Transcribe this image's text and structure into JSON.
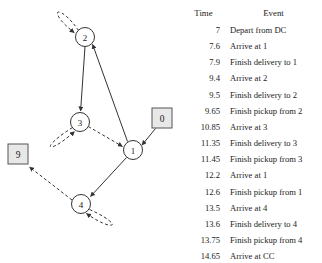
{
  "diagram": {
    "nodes": [
      {
        "id": "node-2",
        "label": "2",
        "shape": "circle",
        "cx": 85,
        "cy": 37,
        "r": 9.5
      },
      {
        "id": "node-3",
        "label": "3",
        "shape": "circle",
        "cx": 80,
        "cy": 122,
        "r": 9.5
      },
      {
        "id": "node-1",
        "label": "1",
        "shape": "circle",
        "cx": 133,
        "cy": 150,
        "r": 9.5
      },
      {
        "id": "node-4",
        "label": "4",
        "shape": "circle",
        "cx": 81,
        "cy": 204,
        "r": 9.5
      },
      {
        "id": "depot-0",
        "label": "0",
        "shape": "square",
        "cx": 162,
        "cy": 118,
        "size": 20
      },
      {
        "id": "depot-9",
        "label": "9",
        "shape": "square",
        "cx": 18,
        "cy": 154,
        "size": 20
      }
    ],
    "edges": [
      {
        "id": "edge-1-2",
        "from": "1",
        "to": "2",
        "style": "solid"
      },
      {
        "id": "edge-2-3",
        "from": "2",
        "to": "3",
        "style": "solid"
      },
      {
        "id": "edge-3-1",
        "from": "3",
        "to": "1",
        "style": "dashed"
      },
      {
        "id": "edge-0-1",
        "from": "0",
        "to": "1",
        "style": "solid"
      },
      {
        "id": "edge-1-4",
        "from": "1",
        "to": "4",
        "style": "solid"
      },
      {
        "id": "edge-4-9",
        "from": "4",
        "to": "9",
        "style": "dashed"
      },
      {
        "id": "selfloop-2",
        "from": "2",
        "to": "2",
        "style": "dashed"
      },
      {
        "id": "selfloop-3",
        "from": "3",
        "to": "3",
        "style": "dashed"
      },
      {
        "id": "selfloop-4",
        "from": "4",
        "to": "4",
        "style": "dashed"
      }
    ],
    "colors": {
      "stroke": "#333333",
      "node_fill": "#ffffff",
      "depot_fill": "#e8e8e8",
      "depot_stroke": "#555555"
    }
  },
  "table": {
    "headers": {
      "time": "Time",
      "event": "Event"
    },
    "rows": [
      {
        "time": "7",
        "event": "Depart from DC"
      },
      {
        "time": "7.6",
        "event": "Arrive at 1"
      },
      {
        "time": "7.9",
        "event": "Finish delivery to 1"
      },
      {
        "time": "9.4",
        "event": "Arrive at 2"
      },
      {
        "time": "9.5",
        "event": "Finish delivery to 2"
      },
      {
        "time": "9.65",
        "event": "Finish pickup from 2"
      },
      {
        "time": "10.85",
        "event": "Arrive at 3"
      },
      {
        "time": "11.35",
        "event": "Finish delivery to 3"
      },
      {
        "time": "11.45",
        "event": "Finish pickup from 3"
      },
      {
        "time": "12.2",
        "event": "Arrive at 1"
      },
      {
        "time": "12.6",
        "event": "Finish pickup from 1"
      },
      {
        "time": "13.5",
        "event": "Arrive at 4"
      },
      {
        "time": "13.6",
        "event": "Finish delivery to 4"
      },
      {
        "time": "13.75",
        "event": "Finish pickup from 4"
      },
      {
        "time": "14.65",
        "event": "Arrive at CC"
      }
    ]
  }
}
